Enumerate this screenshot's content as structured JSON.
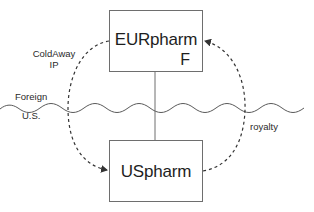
{
  "diagram": {
    "entities": {
      "eur": {
        "name": "EURpharm",
        "subscript": "F"
      },
      "us": {
        "name": "USpharm"
      }
    },
    "border": {
      "above_label": "Foreign",
      "below_label": "U.S."
    },
    "flows": {
      "ip": {
        "label_line1": "ColdAway",
        "label_line2": "IP",
        "from": "EURpharm",
        "to": "USpharm"
      },
      "royalty": {
        "label": "royalty",
        "from": "USpharm",
        "to": "EURpharm"
      }
    },
    "colors": {
      "line": "#555555",
      "box_border": "#6e6e6e",
      "text": "#222222"
    }
  }
}
